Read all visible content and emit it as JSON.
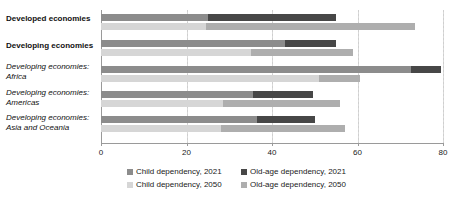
{
  "chart_data": {
    "type": "bar",
    "orientation": "horizontal",
    "stacked": true,
    "title": "",
    "subtitle": "",
    "xlabel": "",
    "ylabel": "",
    "xlim": [
      0,
      80
    ],
    "xticks": [
      0,
      20,
      40,
      60,
      80
    ],
    "xticklabels": [
      "0",
      "20",
      "40",
      "60",
      "80"
    ],
    "grid": true,
    "grid_axis": "x",
    "legend_position": "bottom",
    "categories": [
      "Developed economies",
      "Developing economies",
      "Developing economies: Africa",
      "Developing economies: Americas",
      "Developing economies: Asia and Oceania"
    ],
    "series": [
      {
        "name": "Child dependency, 2021",
        "color": "#8c8c8c",
        "values": [
          25.0,
          43.0,
          72.5,
          35.5,
          36.5
        ]
      },
      {
        "name": "Old-age dependency, 2021",
        "color": "#474747",
        "values": [
          30.0,
          12.0,
          7.0,
          14.0,
          13.5
        ]
      },
      {
        "name": "Child dependency, 2050",
        "color": "#d6d6d6",
        "values": [
          24.5,
          35.0,
          51.0,
          28.5,
          28.0
        ]
      },
      {
        "name": "Old-age dependency, 2050",
        "color": "#aeaeae",
        "values": [
          49.0,
          24.0,
          9.5,
          27.5,
          29.0
        ]
      }
    ],
    "totals_2021": [
      55.0,
      55.0,
      79.5,
      49.5,
      50.0
    ],
    "totals_2050": [
      73.5,
      59.0,
      60.5,
      56.0,
      57.0
    ]
  },
  "axis": {
    "ticks": [
      {
        "value": 0,
        "label": "0"
      },
      {
        "value": 20,
        "label": "20"
      },
      {
        "value": 40,
        "label": "40"
      },
      {
        "value": 60,
        "label": "60"
      },
      {
        "value": 80,
        "label": "80"
      }
    ]
  },
  "categories": [
    {
      "id": "developed-economies",
      "lines": [
        "Developed economies"
      ],
      "style": "bold"
    },
    {
      "id": "developing-economies",
      "lines": [
        "Developing economies"
      ],
      "style": "bold"
    },
    {
      "id": "africa",
      "lines": [
        "Developing economies:",
        "Africa"
      ],
      "style": "italic"
    },
    {
      "id": "americas",
      "lines": [
        "Developing economies:",
        "Americas"
      ],
      "style": "italic"
    },
    {
      "id": "asia-and-oceania",
      "lines": [
        "Developing economies:",
        "Asia and Oceania"
      ],
      "style": "italic"
    }
  ],
  "legend": {
    "items": [
      {
        "label": "Child dependency, 2021",
        "color": "#8c8c8c"
      },
      {
        "label": "Old-age dependency, 2021",
        "color": "#474747"
      },
      {
        "label": "Child dependency, 2050",
        "color": "#d6d6d6"
      },
      {
        "label": "Old-age dependency, 2050",
        "color": "#aeaeae"
      }
    ]
  }
}
